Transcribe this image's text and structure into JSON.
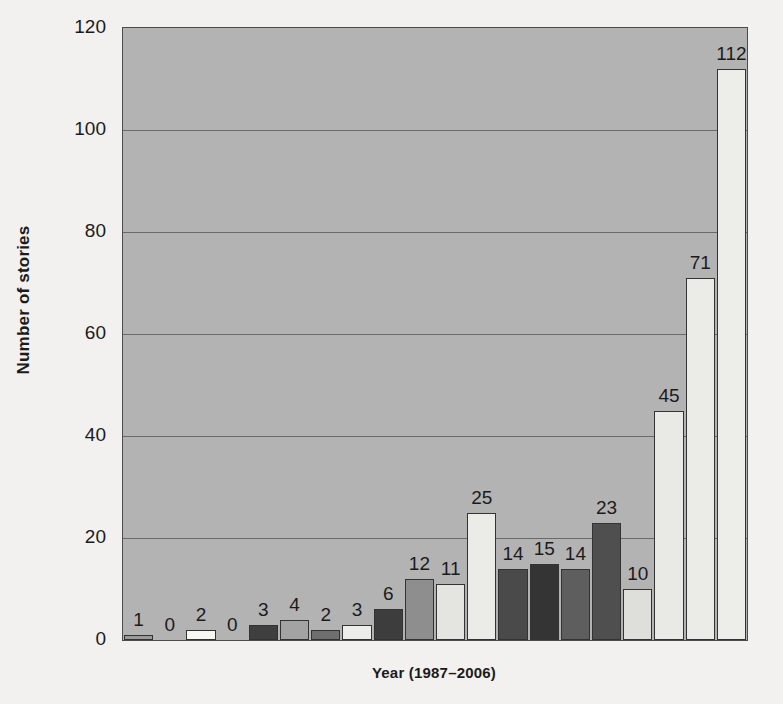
{
  "chart_data": {
    "type": "bar",
    "title": "",
    "xlabel": "Year (1987–2006)",
    "ylabel": "Number of stories",
    "categories": [
      "1987",
      "1988",
      "1989",
      "1990",
      "1991",
      "1992",
      "1993",
      "1994",
      "1995",
      "1996",
      "1997",
      "1998",
      "1999",
      "2000",
      "2001",
      "2002",
      "2003",
      "2004",
      "2005",
      "2006"
    ],
    "values": [
      1,
      0,
      2,
      0,
      3,
      4,
      2,
      3,
      6,
      12,
      11,
      25,
      14,
      15,
      14,
      23,
      10,
      45,
      71,
      112
    ],
    "bar_labels": [
      "1",
      "0",
      "2",
      "0",
      "3",
      "4",
      "2",
      "3",
      "6",
      "12",
      "11",
      "25",
      "14",
      "15",
      "14",
      "23",
      "10",
      "45",
      "71",
      "112"
    ],
    "bar_colors": [
      "#9a9a9a",
      "#f2f2ef",
      "#f7f7f4",
      "#b3b3b3",
      "#3f3f3f",
      "#a3a3a3",
      "#6f6f6f",
      "#ededea",
      "#3d3d3d",
      "#8e8e8e",
      "#e4e4e1",
      "#ebebe8",
      "#4a4a4a",
      "#343434",
      "#5e5e5e",
      "#4f4f4f",
      "#dedeDB",
      "#e9e9e6",
      "#ebebe8",
      "#ededea"
    ],
    "ylim": [
      0,
      120
    ],
    "y_ticks": [
      0,
      20,
      40,
      60,
      80,
      100,
      120
    ],
    "y_tick_labels": [
      "0",
      "20",
      "40",
      "60",
      "80",
      "100",
      "120"
    ],
    "grid": true,
    "grid_axis": "y",
    "legend": "none",
    "plot_background": "#b3b3b3",
    "figure_background": "#f2f1ef",
    "axis_color": "#1b1b1b",
    "gridline_color": "#6a6a6a",
    "bar_edge_color": "#333333",
    "n_bars": 20
  }
}
